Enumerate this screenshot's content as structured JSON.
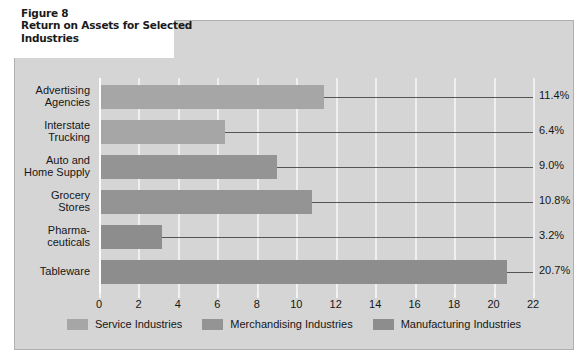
{
  "figure": {
    "title_line1": "Figure 8",
    "title_line2": "Return on Assets for Selected",
    "title_line3": "Industries"
  },
  "colors": {
    "panel_background": "#d5d5d5",
    "title_background": "#ffffff",
    "gridline": "#efefef",
    "leader_line": "#555555",
    "service": "#a6a6a6",
    "merchandising": "#949494",
    "manufacturing": "#8d8d8d",
    "text": "#161616"
  },
  "legend": {
    "items": [
      {
        "label": "Service Industries",
        "color": "#a6a6a6",
        "swatch": "legend-swatch-service"
      },
      {
        "label": "Merchandising Industries",
        "color": "#949494",
        "swatch": "legend-swatch-merchandising"
      },
      {
        "label": "Manufacturing Industries",
        "color": "#8d8d8d",
        "swatch": "legend-swatch-manufacturing"
      }
    ]
  },
  "chart_data": {
    "type": "bar",
    "orientation": "horizontal",
    "title": "Return on Assets for Selected Industries",
    "xlabel": "",
    "ylabel": "",
    "xlim": [
      0,
      22
    ],
    "xticks": [
      0,
      2,
      4,
      6,
      8,
      10,
      12,
      14,
      16,
      18,
      20,
      22
    ],
    "xtick_labels": [
      "0",
      "2",
      "4",
      "6",
      "8",
      "10",
      "12",
      "14",
      "16",
      "18",
      "20",
      "22"
    ],
    "grid": "vertical",
    "legend_position": "bottom-center",
    "categories": [
      "Advertising Agencies",
      "Interstate Trucking",
      "Auto and Home Supply",
      "Grocery Stores",
      "Pharmaceuticals",
      "Tableware"
    ],
    "category_lines": [
      [
        "Advertising",
        "Agencies"
      ],
      [
        "Interstate",
        "Trucking"
      ],
      [
        "Auto and",
        "Home Supply"
      ],
      [
        "Grocery",
        "Stores"
      ],
      [
        "Pharma-",
        "ceuticals"
      ],
      [
        "Tableware"
      ]
    ],
    "values": [
      11.4,
      6.4,
      9.0,
      10.8,
      3.2,
      20.7
    ],
    "value_labels": [
      "11.4%",
      "6.4%",
      "9.0%",
      "10.8%",
      "3.2%",
      "20.7%"
    ],
    "groups": [
      "Service Industries",
      "Service Industries",
      "Merchandising Industries",
      "Merchandising Industries",
      "Manufacturing Industries",
      "Manufacturing Industries"
    ],
    "bar_colors": [
      "#a6a6a6",
      "#a6a6a6",
      "#949494",
      "#949494",
      "#8d8d8d",
      "#8d8d8d"
    ],
    "series": [
      {
        "name": "Return on Assets",
        "values": [
          11.4,
          6.4,
          9.0,
          10.8,
          3.2,
          20.7
        ]
      }
    ]
  }
}
